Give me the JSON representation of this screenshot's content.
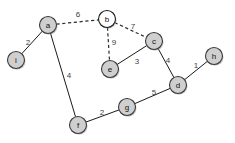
{
  "diagram": {
    "type": "node-link-graph",
    "width": 235,
    "height": 143,
    "background_color": "#ffffff",
    "node_fill_color": "#cfcfcf",
    "node_open_fill_color": "#ffffff",
    "node_stroke_color": "#3a3a3a",
    "edge_color": "#1a1a1a",
    "dashed_edge_color": "#2b2b2b",
    "label_color": "#3d3d3d",
    "node_radius": 8.5,
    "nodes": [
      {
        "id": "a",
        "label": "a",
        "x": 48,
        "y": 25,
        "style": "filled"
      },
      {
        "id": "b",
        "label": "b",
        "x": 107,
        "y": 19,
        "style": "open"
      },
      {
        "id": "c",
        "label": "c",
        "x": 154,
        "y": 41,
        "style": "filled"
      },
      {
        "id": "d",
        "label": "d",
        "x": 178,
        "y": 85,
        "style": "filled"
      },
      {
        "id": "e",
        "label": "e",
        "x": 110,
        "y": 69,
        "style": "filled"
      },
      {
        "id": "f",
        "label": "f",
        "x": 78,
        "y": 125,
        "style": "filled"
      },
      {
        "id": "g",
        "label": "g",
        "x": 127,
        "y": 107,
        "style": "filled"
      },
      {
        "id": "h",
        "label": "h",
        "x": 214,
        "y": 56,
        "style": "filled"
      },
      {
        "id": "i",
        "label": "i",
        "x": 16,
        "y": 60,
        "style": "filled"
      }
    ],
    "edges": [
      {
        "id": "a-i",
        "source": "a",
        "target": "i",
        "weight": "2",
        "style": "solid",
        "label_x": 28,
        "label_y": 42
      },
      {
        "id": "a-b",
        "source": "a",
        "target": "b",
        "weight": "6",
        "style": "dashed",
        "label_x": 78,
        "label_y": 14
      },
      {
        "id": "a-f",
        "source": "a",
        "target": "f",
        "weight": "4",
        "style": "solid",
        "label_x": 69,
        "label_y": 75
      },
      {
        "id": "b-c",
        "source": "b",
        "target": "c",
        "weight": "7",
        "style": "dashed",
        "label_x": 133,
        "label_y": 26
      },
      {
        "id": "b-e",
        "source": "b",
        "target": "e",
        "weight": "9",
        "style": "dashed",
        "label_x": 114,
        "label_y": 42
      },
      {
        "id": "c-e",
        "source": "c",
        "target": "e",
        "weight": "3",
        "style": "solid",
        "label_x": 137,
        "label_y": 61
      },
      {
        "id": "c-d",
        "source": "c",
        "target": "d",
        "weight": "4",
        "style": "solid",
        "label_x": 168,
        "label_y": 60
      },
      {
        "id": "d-h",
        "source": "d",
        "target": "h",
        "weight": "1",
        "style": "solid",
        "label_x": 196,
        "label_y": 65
      },
      {
        "id": "d-g",
        "source": "d",
        "target": "g",
        "weight": "5",
        "style": "solid",
        "label_x": 154,
        "label_y": 92
      },
      {
        "id": "g-f",
        "source": "g",
        "target": "f",
        "weight": "2",
        "style": "solid",
        "label_x": 102,
        "label_y": 112
      }
    ]
  }
}
